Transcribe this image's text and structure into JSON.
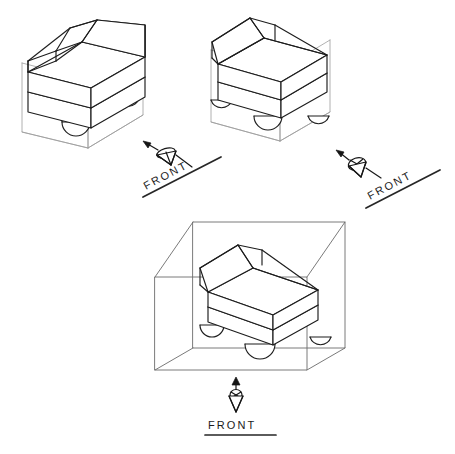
{
  "sheet": {
    "title": "Isometric views of wheeled seat unit with viewing-direction markers",
    "background_color": "#ffffff",
    "line_color": "#1d1d1d",
    "construction_line_color": "#9d9d9d",
    "glass_box_color": "#6b6b6b",
    "width": 455,
    "height": 454
  },
  "views": [
    {
      "id": "view-top-left",
      "name": "isometric-view-left",
      "description": "Wheeled seat unit drawn in isometric with light construction box",
      "has_construction_box": true,
      "has_glass_box": false,
      "wheel_count": 3
    },
    {
      "id": "view-top-right",
      "name": "isometric-view-right",
      "description": "Wheeled seat unit drawn in isometric from opposite rotation with light construction box",
      "has_construction_box": true,
      "has_glass_box": false,
      "wheel_count": 3
    },
    {
      "id": "view-bottom",
      "name": "isometric-view-in-glass-box",
      "description": "Wheeled seat unit enclosed in a transparent projection box",
      "has_construction_box": false,
      "has_glass_box": true,
      "wheel_count": 3
    }
  ],
  "markers": [
    {
      "id": "marker-left",
      "label": "FRONT",
      "symbol": "eye-cone-icon",
      "arrow_direction": "up-left",
      "label_rotation_deg": -28,
      "underlined": true
    },
    {
      "id": "marker-right",
      "label": "FRONT",
      "symbol": "eye-cone-icon",
      "arrow_direction": "up-left",
      "label_rotation_deg": -28,
      "underlined": true
    },
    {
      "id": "marker-bottom",
      "label": "FRONT",
      "symbol": "eye-cone-icon",
      "arrow_direction": "up",
      "label_rotation_deg": 0,
      "underlined": true
    }
  ]
}
